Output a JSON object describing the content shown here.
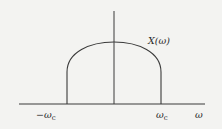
{
  "diagram": {
    "type": "frequency-spectrum",
    "curve_label": "X(ω)",
    "axis_label_x": "ω",
    "tick_left": {
      "sym": "−ω",
      "sub": "c"
    },
    "tick_right": {
      "sym": "ω",
      "sub": "c"
    },
    "colors": {
      "line": "#3a3a3a",
      "background": "#f3f3f1"
    }
  }
}
